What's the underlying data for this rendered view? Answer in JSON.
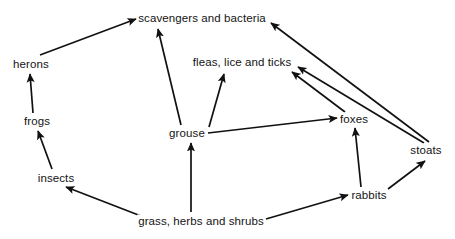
{
  "diagram": {
    "type": "food-web",
    "title": "",
    "width": 455,
    "height": 239,
    "background_color": "#ffffff",
    "line_color": "#111111",
    "text_color": "#141414",
    "nodes": [
      {
        "id": "scavengers",
        "label": "scavengers and bacteria",
        "x": 202,
        "y": 18
      },
      {
        "id": "herons",
        "label": "herons",
        "x": 31,
        "y": 64
      },
      {
        "id": "fleas",
        "label": "fleas, lice and ticks",
        "x": 242,
        "y": 62
      },
      {
        "id": "foxes",
        "label": "foxes",
        "x": 354,
        "y": 119
      },
      {
        "id": "frogs",
        "label": "frogs",
        "x": 37,
        "y": 121
      },
      {
        "id": "grouse",
        "label": "grouse",
        "x": 187,
        "y": 133
      },
      {
        "id": "stoats",
        "label": "stoats",
        "x": 426,
        "y": 150
      },
      {
        "id": "insects",
        "label": "insects",
        "x": 56,
        "y": 178
      },
      {
        "id": "rabbits",
        "label": "rabbits",
        "x": 369,
        "y": 195
      },
      {
        "id": "grass",
        "label": "grass, herbs and shrubs",
        "x": 201,
        "y": 221
      }
    ],
    "links": [
      {
        "from": "herons",
        "to": "scavengers",
        "x1": 40,
        "y1": 55,
        "x2": 136,
        "y2": 19
      },
      {
        "from": "grouse",
        "to": "scavengers",
        "x1": 181,
        "y1": 125,
        "x2": 158,
        "y2": 29
      },
      {
        "from": "stoats",
        "to": "scavengers",
        "x1": 429,
        "y1": 142,
        "x2": 271,
        "y2": 23
      },
      {
        "from": "grouse",
        "to": "fleas",
        "x1": 209,
        "y1": 127,
        "x2": 224,
        "y2": 74
      },
      {
        "from": "foxes",
        "to": "fleas",
        "x1": 345,
        "y1": 112,
        "x2": 292,
        "y2": 72
      },
      {
        "from": "stoats",
        "to": "fleas",
        "x1": 424,
        "y1": 143,
        "x2": 298,
        "y2": 67
      },
      {
        "from": "grouse",
        "to": "foxes",
        "x1": 208,
        "y1": 133,
        "x2": 337,
        "y2": 118
      },
      {
        "from": "rabbits",
        "to": "foxes",
        "x1": 361,
        "y1": 187,
        "x2": 355,
        "y2": 128
      },
      {
        "from": "rabbits",
        "to": "stoats",
        "x1": 388,
        "y1": 189,
        "x2": 425,
        "y2": 161
      },
      {
        "from": "insects",
        "to": "frogs",
        "x1": 52,
        "y1": 169,
        "x2": 38,
        "y2": 131
      },
      {
        "from": "frogs",
        "to": "herons",
        "x1": 33,
        "y1": 113,
        "x2": 30,
        "y2": 74
      },
      {
        "from": "grass",
        "to": "insects",
        "x1": 141,
        "y1": 216,
        "x2": 66,
        "y2": 187
      },
      {
        "from": "grass",
        "to": "grouse",
        "x1": 191,
        "y1": 212,
        "x2": 191,
        "y2": 143
      },
      {
        "from": "grass",
        "to": "rabbits",
        "x1": 266,
        "y1": 219,
        "x2": 348,
        "y2": 195
      }
    ]
  }
}
